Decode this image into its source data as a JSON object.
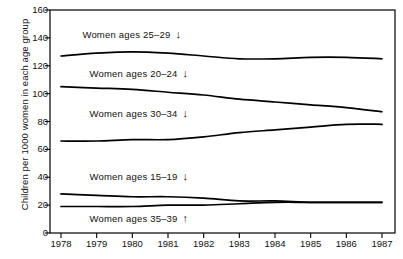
{
  "chart_data": {
    "type": "line",
    "title": "",
    "xlabel": "",
    "ylabel": "Children per 1000 women in each age group",
    "x": [
      1978,
      1979,
      1980,
      1981,
      1982,
      1983,
      1984,
      1985,
      1986,
      1987
    ],
    "xtick_labels": [
      "1978",
      "1979",
      "1980",
      "1981",
      "1982",
      "1983",
      "1984",
      "1985",
      "1986",
      "1987"
    ],
    "ylim": [
      0,
      160
    ],
    "yticks": [
      0,
      20,
      40,
      60,
      80,
      100,
      120,
      140,
      160
    ],
    "ytick_labels": [
      "0",
      "20",
      "40",
      "60",
      "80",
      "100",
      "120",
      "140",
      "160"
    ],
    "grid": false,
    "legend_position": "inline-annotations",
    "series": [
      {
        "name": "Women ages 25-29",
        "label": "Women ages 25–29",
        "trend_arrow": "↓",
        "label_x": 1978.6,
        "label_y": 143,
        "values": [
          127,
          129,
          130,
          129,
          127,
          125,
          125,
          126,
          126,
          125
        ]
      },
      {
        "name": "Women ages 20-24",
        "label": "Women ages 20–24",
        "trend_arrow": "↓",
        "label_x": 1978.8,
        "label_y": 115,
        "values": [
          105,
          104,
          103,
          101,
          99,
          96,
          94,
          92,
          90,
          87
        ]
      },
      {
        "name": "Women ages 30-34",
        "label": "Women ages 30–34",
        "trend_arrow": "↓",
        "label_x": 1978.8,
        "label_y": 86,
        "values": [
          66,
          66,
          67,
          67,
          69,
          72,
          74,
          76,
          78,
          78
        ]
      },
      {
        "name": "Women ages 15-19",
        "label": "Women ages 15–19",
        "trend_arrow": "↓",
        "label_x": 1978.8,
        "label_y": 41,
        "values": [
          28,
          27,
          26,
          26,
          25,
          23,
          23,
          22,
          22,
          22
        ]
      },
      {
        "name": "Women ages 35-39",
        "label": "Women ages 35–39",
        "trend_arrow": "↑",
        "label_x": 1978.8,
        "label_y": 11,
        "values": [
          19,
          19,
          19,
          20,
          20,
          21,
          22,
          22,
          22,
          22
        ]
      }
    ]
  },
  "axis": {
    "color": "#000000",
    "line_color": "#000000"
  }
}
